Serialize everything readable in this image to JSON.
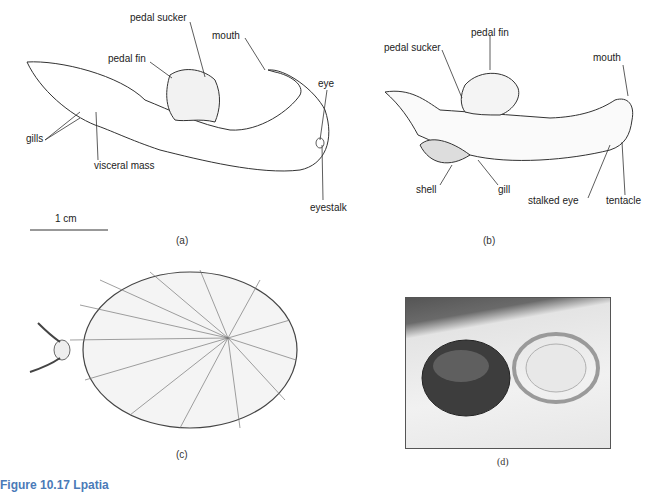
{
  "figure": {
    "title": "Figure 10.17  Lpatia",
    "panels": [
      {
        "id": "a",
        "caption": "(a)",
        "labels": [
          "pedal sucker",
          "pedal fin",
          "mouth",
          "eye",
          "gills",
          "visceral mass",
          "eyestalk"
        ],
        "scale_bar": "1 cm"
      },
      {
        "id": "b",
        "caption": "(b)",
        "labels": [
          "pedal sucker",
          "pedal fin",
          "mouth",
          "shell",
          "gill",
          "stalked eye",
          "tentacle"
        ]
      },
      {
        "id": "c",
        "caption": "(c)"
      },
      {
        "id": "d",
        "caption": "(d)"
      }
    ]
  }
}
